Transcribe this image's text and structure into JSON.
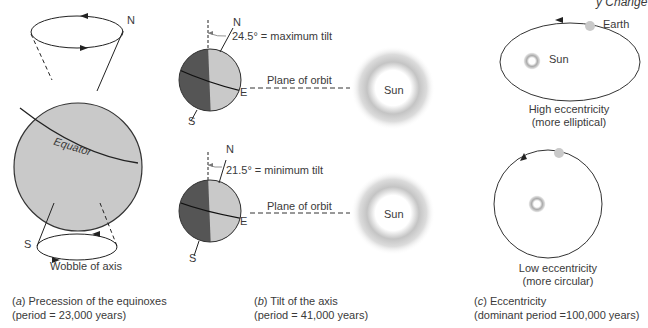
{
  "header": {
    "running_text": "y Change"
  },
  "panel_a": {
    "labels": {
      "north": "N",
      "south": "S",
      "equator": "Equator",
      "wobble": "Wobble of axis"
    },
    "caption": {
      "letter": "a",
      "line1": "Precession of the equinoxes",
      "line2": "(period = 23,000 years)"
    }
  },
  "panel_b": {
    "top": {
      "north": "N",
      "south": "S",
      "east": "E",
      "tilt_label": "24.5° = maximum tilt",
      "plane_label": "Plane of orbit",
      "sun_label": "Sun"
    },
    "bottom": {
      "north": "N",
      "south": "S",
      "east": "E",
      "tilt_label": "21.5° = minimum tilt",
      "plane_label": "Plane of orbit",
      "sun_label": "Sun"
    },
    "caption": {
      "letter": "b",
      "line1": "Tilt of the axis",
      "line2": "(period = 41,000 years)"
    }
  },
  "panel_c": {
    "top": {
      "earth_label": "Earth",
      "sun_label": "Sun",
      "desc1": "High eccentricity",
      "desc2": "(more elliptical)"
    },
    "bottom": {
      "desc1": "Low eccentricity",
      "desc2": "(more circular)"
    },
    "caption": {
      "letter": "c",
      "line1": "Eccentricity",
      "line2": "(dominant period =100,000 years)"
    }
  },
  "colors": {
    "earth_light": "#c9c9c9",
    "earth_dark": "#555555",
    "line": "#222222",
    "sun_halo": "#b0b0b0"
  }
}
